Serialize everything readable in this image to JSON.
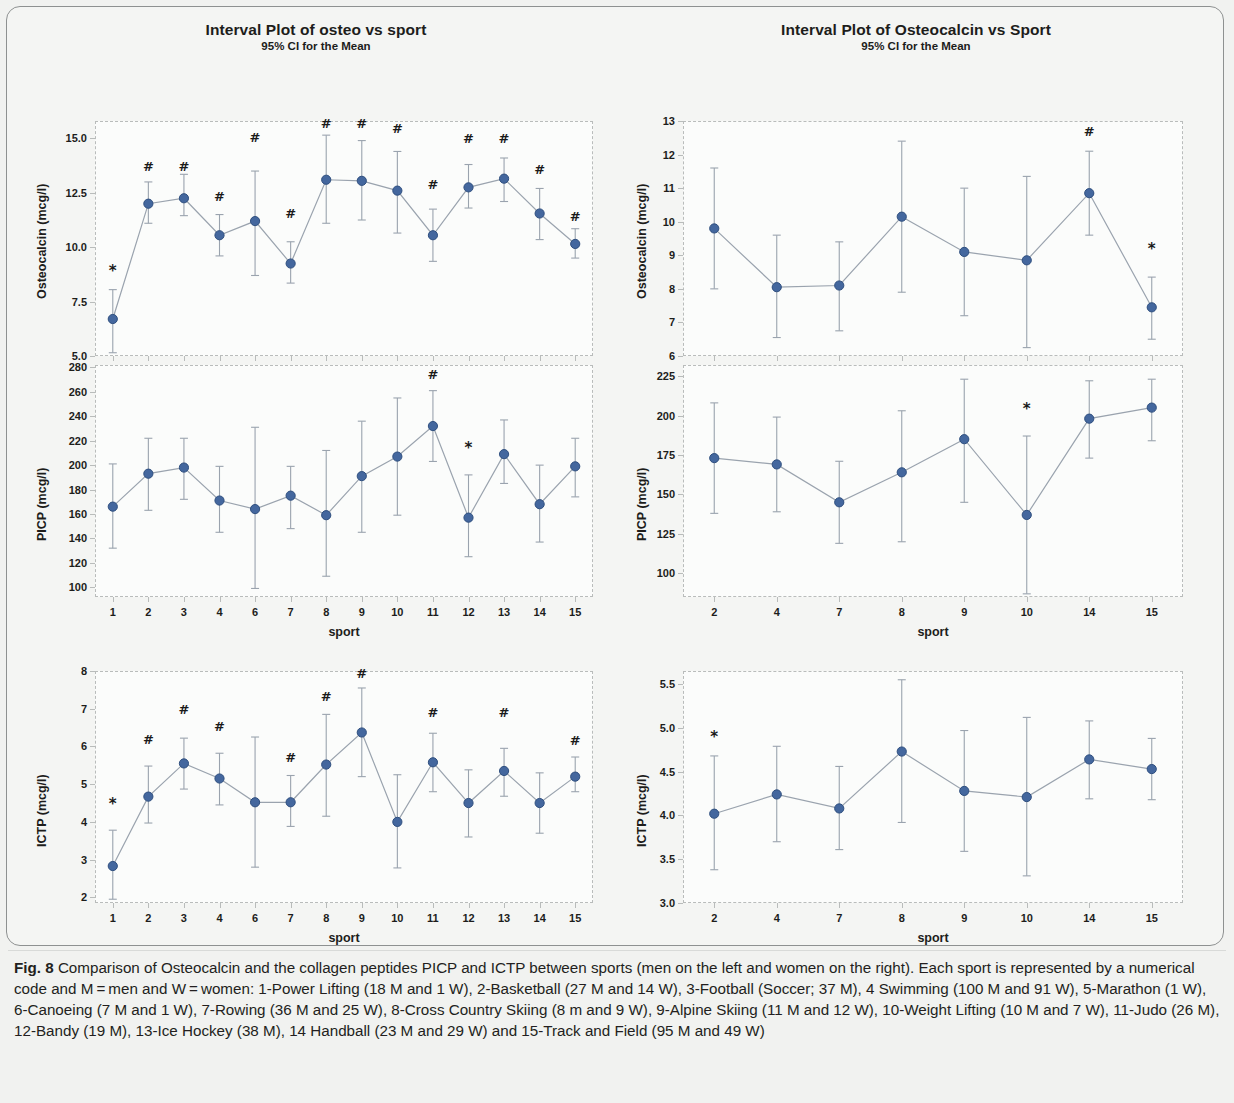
{
  "figure": {
    "label": "Fig. 8",
    "caption": "Comparison of Osteocalcin and the collagen peptides PICP and ICTP between sports (men on the left and women on the right). Each sport is represented by a numerical code and M = men and W = women: 1-Power Lifting (18 M and 1 W), 2-Basketball (27 M and 14 W), 3-Football (Soccer; 37 M), 4 Swimming (100 M and 91 W), 5-Marathon (1 W), 6-Canoeing (7 M and 1 W), 7-Rowing (36 M and 25 W), 8-Cross Country Skiing (8 m and 9 W), 9-Alpine Skiing (11 M and 12 W), 10-Weight Lifting (10 M and 7 W), 11-Judo (26 M), 12-Bandy (19 M), 13-Ice Hockey (38 M), 14 Handball (23 M and 29 W) and 15-Track and Field (95 M and 49 W)"
  },
  "colors": {
    "marker": "#44679e",
    "marker_edge": "#2f4f7f",
    "line": "#9aa3ae",
    "errorbar": "#9aa3ae",
    "plot_border": "#b9bcbb",
    "page_background": "#f1f2f0",
    "panel_background": "#fbfcfb",
    "text": "#1d1d1b"
  },
  "chart_data": [
    {
      "id": "osteocalcin-men",
      "type": "scatter",
      "title": "Interval Plot of osteo vs sport",
      "subtitle": "95% CI for the Mean",
      "xlabel": "sport",
      "ylabel": "Osteocalcin (mcg/l)",
      "ylim": [
        5.0,
        15.8
      ],
      "yticks": [
        "5.0",
        "7.5",
        "10.0",
        "12.5",
        "15.0"
      ],
      "ytickvals": [
        5.0,
        7.5,
        10.0,
        12.5,
        15.0
      ],
      "grid": false,
      "legend": "none",
      "categories": [
        "1",
        "2",
        "3",
        "4",
        "6",
        "7",
        "8",
        "9",
        "10",
        "11",
        "12",
        "13",
        "14",
        "15"
      ],
      "values": [
        6.7,
        12.0,
        12.25,
        10.55,
        11.2,
        9.25,
        13.1,
        13.05,
        12.6,
        10.55,
        12.75,
        13.15,
        11.55,
        10.15
      ],
      "ci_low": [
        5.15,
        11.1,
        11.45,
        9.6,
        8.7,
        8.35,
        11.1,
        11.25,
        10.65,
        9.35,
        11.8,
        12.1,
        10.35,
        9.5
      ],
      "ci_high": [
        8.05,
        13.0,
        13.35,
        11.5,
        13.5,
        10.25,
        15.15,
        14.9,
        14.4,
        11.75,
        13.8,
        14.1,
        12.7,
        10.85
      ],
      "annotations": [
        {
          "category": "1",
          "symbol": "*",
          "y": 8.9
        },
        {
          "category": "2",
          "symbol": "#",
          "y": 13.75
        },
        {
          "category": "3",
          "symbol": "#",
          "y": 13.75
        },
        {
          "category": "4",
          "symbol": "#",
          "y": 12.35
        },
        {
          "category": "6",
          "symbol": "#",
          "y": 15.05
        },
        {
          "category": "7",
          "symbol": "#",
          "y": 11.55
        },
        {
          "category": "8",
          "symbol": "#",
          "y": 15.7
        },
        {
          "category": "9",
          "symbol": "#",
          "y": 15.7
        },
        {
          "category": "10",
          "symbol": "#",
          "y": 15.5
        },
        {
          "category": "11",
          "symbol": "#",
          "y": 12.9
        },
        {
          "category": "12",
          "symbol": "#",
          "y": 15.0
        },
        {
          "category": "13",
          "symbol": "#",
          "y": 15.0
        },
        {
          "category": "14",
          "symbol": "#",
          "y": 13.6
        },
        {
          "category": "15",
          "symbol": "#",
          "y": 11.45
        }
      ]
    },
    {
      "id": "osteocalcin-women",
      "type": "scatter",
      "title": "Interval Plot of Osteocalcin vs Sport",
      "subtitle": "95% CI for the Mean",
      "xlabel": "sport",
      "ylabel": "Osteocalcin (mcg/l)",
      "ylim": [
        6,
        13
      ],
      "yticks": [
        "6",
        "7",
        "8",
        "9",
        "10",
        "11",
        "12",
        "13"
      ],
      "ytickvals": [
        6,
        7,
        8,
        9,
        10,
        11,
        12,
        13
      ],
      "grid": false,
      "legend": "none",
      "categories": [
        "2",
        "4",
        "7",
        "8",
        "9",
        "10",
        "14",
        "15"
      ],
      "values": [
        9.8,
        8.05,
        8.1,
        10.15,
        9.1,
        8.85,
        10.85,
        7.45
      ],
      "ci_low": [
        8.0,
        6.55,
        6.75,
        7.9,
        7.2,
        6.25,
        9.6,
        6.5
      ],
      "ci_high": [
        11.6,
        9.6,
        9.4,
        12.4,
        11.0,
        11.35,
        12.1,
        8.35
      ],
      "annotations": [
        {
          "category": "14",
          "symbol": "#",
          "y": 12.7
        },
        {
          "category": "15",
          "symbol": "*",
          "y": 9.2
        }
      ]
    },
    {
      "id": "picp-men",
      "type": "scatter",
      "title": "",
      "subtitle": "",
      "xlabel": "sport",
      "ylabel": "PICP (mcg/l)",
      "ylim": [
        92,
        282
      ],
      "yticks": [
        "100",
        "120",
        "140",
        "160",
        "180",
        "200",
        "220",
        "240",
        "260",
        "280"
      ],
      "ytickvals": [
        100,
        120,
        140,
        160,
        180,
        200,
        220,
        240,
        260,
        280
      ],
      "grid": false,
      "legend": "none",
      "categories": [
        "1",
        "2",
        "3",
        "4",
        "6",
        "7",
        "8",
        "9",
        "10",
        "11",
        "12",
        "13",
        "14",
        "15"
      ],
      "values": [
        166,
        193,
        198,
        171,
        164,
        175,
        159,
        191,
        207,
        232,
        157,
        209,
        168,
        199
      ],
      "ci_low": [
        132,
        163,
        172,
        145,
        99,
        148,
        109,
        145,
        159,
        203,
        125,
        185,
        137,
        174
      ],
      "ci_high": [
        201,
        222,
        222,
        199,
        231,
        199,
        212,
        236,
        255,
        261,
        192,
        237,
        200,
        222
      ],
      "annotations": [
        {
          "category": "11",
          "symbol": "#",
          "y": 275
        },
        {
          "category": "12",
          "symbol": "*",
          "y": 214
        }
      ]
    },
    {
      "id": "picp-women",
      "type": "scatter",
      "title": "",
      "subtitle": "",
      "xlabel": "sport",
      "ylabel": "PICP (mcg/l)",
      "ylim": [
        85,
        232
      ],
      "yticks": [
        "100",
        "125",
        "150",
        "175",
        "200",
        "225"
      ],
      "ytickvals": [
        100,
        125,
        150,
        175,
        200,
        225
      ],
      "grid": false,
      "legend": "none",
      "categories": [
        "2",
        "4",
        "7",
        "8",
        "9",
        "10",
        "14",
        "15"
      ],
      "values": [
        173,
        169,
        145,
        164,
        185,
        137,
        198,
        205
      ],
      "ci_low": [
        138,
        139,
        119,
        120,
        145,
        87,
        173,
        184
      ],
      "ci_high": [
        208,
        199,
        171,
        203,
        223,
        187,
        222,
        223
      ],
      "annotations": [
        {
          "category": "10",
          "symbol": "*",
          "y": 204
        }
      ]
    },
    {
      "id": "ictp-men",
      "type": "scatter",
      "title": "",
      "subtitle": "",
      "xlabel": "sport",
      "ylabel": "ICTP (mcg/l)",
      "ylim": [
        1.85,
        8.0
      ],
      "yticks": [
        "2",
        "3",
        "4",
        "5",
        "6",
        "7",
        "8"
      ],
      "ytickvals": [
        2,
        3,
        4,
        5,
        6,
        7,
        8
      ],
      "grid": false,
      "legend": "none",
      "categories": [
        "1",
        "2",
        "3",
        "4",
        "6",
        "7",
        "8",
        "9",
        "10",
        "11",
        "12",
        "13",
        "14",
        "15"
      ],
      "values": [
        2.83,
        4.67,
        5.55,
        5.15,
        4.52,
        4.52,
        5.52,
        6.37,
        4.0,
        5.58,
        4.5,
        5.35,
        4.5,
        5.2
      ],
      "ci_low": [
        1.95,
        3.97,
        4.87,
        4.45,
        2.8,
        3.88,
        4.15,
        5.2,
        2.78,
        4.8,
        3.6,
        4.68,
        3.7,
        4.8
      ],
      "ci_high": [
        3.78,
        5.48,
        6.22,
        5.82,
        6.25,
        5.23,
        6.85,
        7.55,
        5.25,
        6.35,
        5.38,
        5.95,
        5.3,
        5.72
      ],
      "annotations": [
        {
          "category": "1",
          "symbol": "*",
          "y": 4.47
        },
        {
          "category": "2",
          "symbol": "#",
          "y": 6.2
        },
        {
          "category": "3",
          "symbol": "#",
          "y": 6.98
        },
        {
          "category": "4",
          "symbol": "#",
          "y": 6.55
        },
        {
          "category": "7",
          "symbol": "#",
          "y": 5.72
        },
        {
          "category": "8",
          "symbol": "#",
          "y": 7.33
        },
        {
          "category": "9",
          "symbol": "#",
          "y": 7.95
        },
        {
          "category": "11",
          "symbol": "#",
          "y": 6.9
        },
        {
          "category": "13",
          "symbol": "#",
          "y": 6.9
        },
        {
          "category": "15",
          "symbol": "#",
          "y": 6.18
        }
      ]
    },
    {
      "id": "ictp-women",
      "type": "scatter",
      "title": "",
      "subtitle": "",
      "xlabel": "sport",
      "ylabel": "ICTP (mcg/l)",
      "ylim": [
        3.0,
        5.65
      ],
      "yticks": [
        "3.0",
        "3.5",
        "4.0",
        "4.5",
        "5.0",
        "5.5"
      ],
      "ytickvals": [
        3.0,
        3.5,
        4.0,
        4.5,
        5.0,
        5.5
      ],
      "grid": false,
      "legend": "none",
      "categories": [
        "2",
        "4",
        "7",
        "8",
        "9",
        "10",
        "14",
        "15"
      ],
      "values": [
        4.02,
        4.24,
        4.08,
        4.73,
        4.28,
        4.21,
        4.64,
        4.53
      ],
      "ci_low": [
        3.38,
        3.7,
        3.61,
        3.92,
        3.59,
        3.31,
        4.19,
        4.18
      ],
      "ci_high": [
        4.68,
        4.79,
        4.56,
        5.55,
        4.97,
        5.12,
        5.08,
        4.88
      ],
      "annotations": [
        {
          "category": "2",
          "symbol": "*",
          "y": 4.9
        }
      ]
    }
  ]
}
